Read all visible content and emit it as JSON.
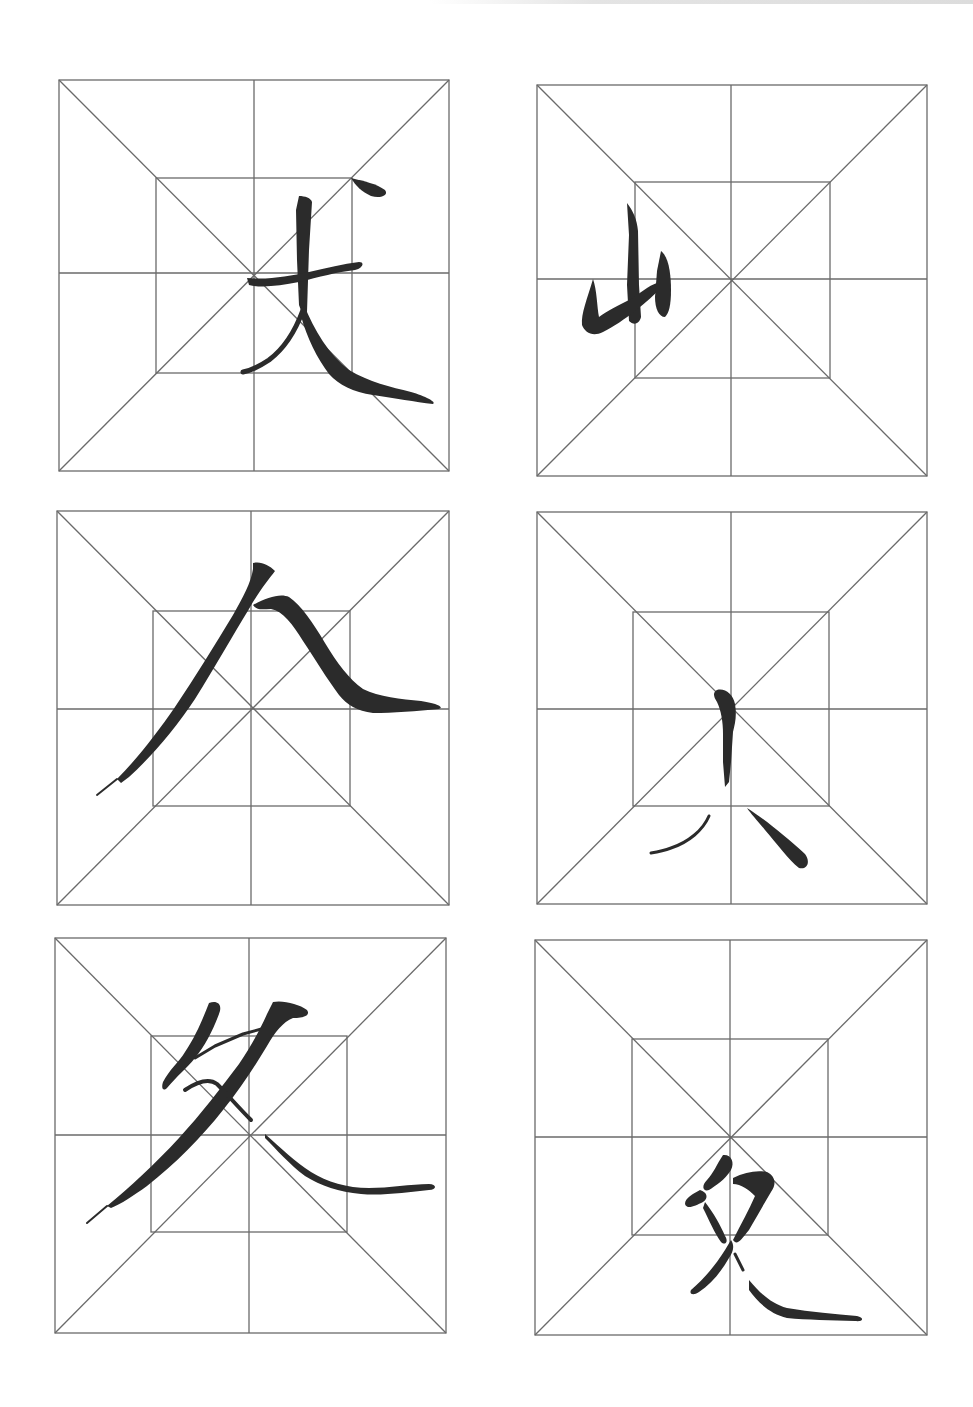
{
  "page": {
    "type": "calligraphy practice sheet",
    "grid_style": "米字格 (rice-character grid with inner square)",
    "grid_color": "#6a6a6a",
    "ink_color": "#2b2b2b",
    "background": "#ffffff"
  },
  "cells": [
    {
      "index": 1,
      "character": "丈",
      "label": "Calligraphy character 丈 (zhang)",
      "box": {
        "x": 59,
        "y": 80,
        "w": 390,
        "h": 391
      }
    },
    {
      "index": 2,
      "character": "山",
      "label": "Calligraphy character 山 (shan), written small in left half",
      "box": {
        "x": 537,
        "y": 85,
        "w": 390,
        "h": 391
      }
    },
    {
      "index": 3,
      "character": "人",
      "label": "Calligraphy character 人 (ren), large with long 捺",
      "box": {
        "x": 57,
        "y": 511,
        "w": 392,
        "h": 394
      }
    },
    {
      "index": 4,
      "character": "八",
      "label": "Calligraphy strokes 八/小 component, vertical dot with two lower strokes",
      "box": {
        "x": 537,
        "y": 512,
        "w": 390,
        "h": 392
      }
    },
    {
      "index": 5,
      "character": "处",
      "label": "Calligraphy character 处/夂 component with long 捺",
      "box": {
        "x": 55,
        "y": 938,
        "w": 391,
        "h": 395
      }
    },
    {
      "index": 6,
      "character": "文",
      "label": "Calligraphy character 文/攵 component in lower half",
      "box": {
        "x": 535,
        "y": 940,
        "w": 392,
        "h": 395
      }
    }
  ]
}
